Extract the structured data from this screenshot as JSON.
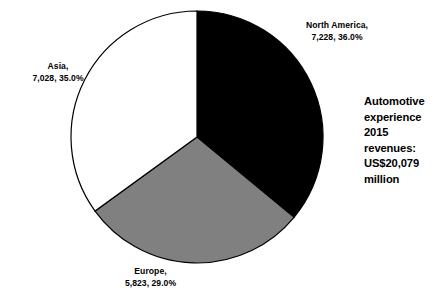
{
  "chart_data": {
    "type": "pie",
    "title": "",
    "categories": [
      "North America",
      "Europe",
      "Asia"
    ],
    "values": [
      7228,
      5823,
      7028
    ],
    "percentages": [
      36.0,
      29.0,
      35.0
    ],
    "colors": [
      "#000000",
      "#808080",
      "#ffffff"
    ],
    "stroke_color": "#000000",
    "start_angle_deg": 0,
    "direction": "clockwise",
    "legend": "none",
    "grid": false,
    "total": 20079,
    "units": "US$ million",
    "labels": [
      {
        "name": "north-america",
        "line1": "North America,",
        "line2": "7,228, 36.0%",
        "color": "#000000"
      },
      {
        "name": "asia",
        "line1": "Asia,",
        "line2": "7,028, 35.0%",
        "color": "#ffffff"
      },
      {
        "name": "europe",
        "line1": "Europe,",
        "line2": "5,823, 29.0%",
        "color": "#808080"
      }
    ]
  },
  "callout": {
    "line1": "Automotive",
    "line2": "experience",
    "line3": "2015",
    "line4": "revenues:",
    "line5": "US$20,079",
    "line6": "million"
  }
}
